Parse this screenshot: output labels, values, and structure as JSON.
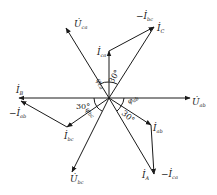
{
  "diagram": {
    "type": "phasor-diagram",
    "origin": [
      109,
      98
    ],
    "phasors": [
      {
        "id": "U_ab",
        "label": "U",
        "subscript": "ab",
        "dot": true,
        "to": [
          190,
          98
        ]
      },
      {
        "id": "U_ca",
        "label": "U",
        "subscript": "ca",
        "dot": true,
        "to": [
          66,
          28
        ]
      },
      {
        "id": "U_bc",
        "label": "U",
        "subscript": "bc",
        "dot": true,
        "to": [
          72,
          172
        ]
      },
      {
        "id": "I_ca",
        "label": "I",
        "subscript": "ca",
        "dot": true,
        "to": [
          109,
          51
        ]
      },
      {
        "id": "I_C",
        "label": "I",
        "subscript": "C",
        "dot": true,
        "to": [
          154,
          27
        ]
      },
      {
        "id": "neg_I_bc",
        "label": "-I",
        "subscript": "bc",
        "dot": true
      },
      {
        "id": "I_B",
        "label": "I",
        "subscript": "B",
        "dot": true,
        "to": [
          19,
          98
        ]
      },
      {
        "id": "neg_I_ab",
        "label": "-I",
        "subscript": "ab",
        "dot": true,
        "to": [
          21,
          101
        ]
      },
      {
        "id": "I_bc",
        "label": "I",
        "subscript": "bc",
        "dot": true,
        "to": [
          67,
          127
        ]
      },
      {
        "id": "I_ab",
        "label": "I",
        "subscript": "ab",
        "dot": true,
        "to": [
          151,
          125
        ]
      },
      {
        "id": "I_A",
        "label": "I",
        "subscript": "A",
        "dot": true,
        "to": [
          154,
          174
        ]
      },
      {
        "id": "neg_I_ca",
        "label": "-I",
        "subscript": "ca",
        "dot": true
      }
    ],
    "angles": [
      {
        "label": "φ",
        "subscript": "ca"
      },
      {
        "label": "30°"
      },
      {
        "label": "30°",
        "position": "left"
      },
      {
        "label": "φ",
        "subscript": "bc"
      },
      {
        "label": "φ",
        "subscript": "ab"
      },
      {
        "label": "30°",
        "position": "lower-right"
      }
    ]
  },
  "labels": {
    "U_ab": {
      "main": "U̇",
      "sub": "ab"
    },
    "U_ca": {
      "main": "U̇",
      "sub": "ca"
    },
    "U_bc": {
      "main": "U̇",
      "sub": "bc"
    },
    "I_ca": {
      "main": "İ",
      "sub": "ca"
    },
    "I_C": {
      "main": "İ",
      "sub": "C"
    },
    "neg_I_bc": {
      "main": "−İ",
      "sub": "bc"
    },
    "I_B": {
      "main": "İ",
      "sub": "B"
    },
    "neg_I_ab": {
      "main": "−İ",
      "sub": "ab"
    },
    "I_bc": {
      "main": "İ",
      "sub": "bc"
    },
    "I_ab": {
      "main": "İ",
      "sub": "ab"
    },
    "I_A": {
      "main": "İ",
      "sub": "A"
    },
    "neg_I_ca": {
      "main": "−İ",
      "sub": "ca"
    },
    "phi_ca": {
      "main": "φ",
      "sub": "ca"
    },
    "phi_bc": {
      "main": "φ",
      "sub": "bc"
    },
    "phi_ab": {
      "main": "φ",
      "sub": "ab"
    },
    "ang30_top": "30°",
    "ang30_left": "30°",
    "ang30_right": "30°"
  }
}
